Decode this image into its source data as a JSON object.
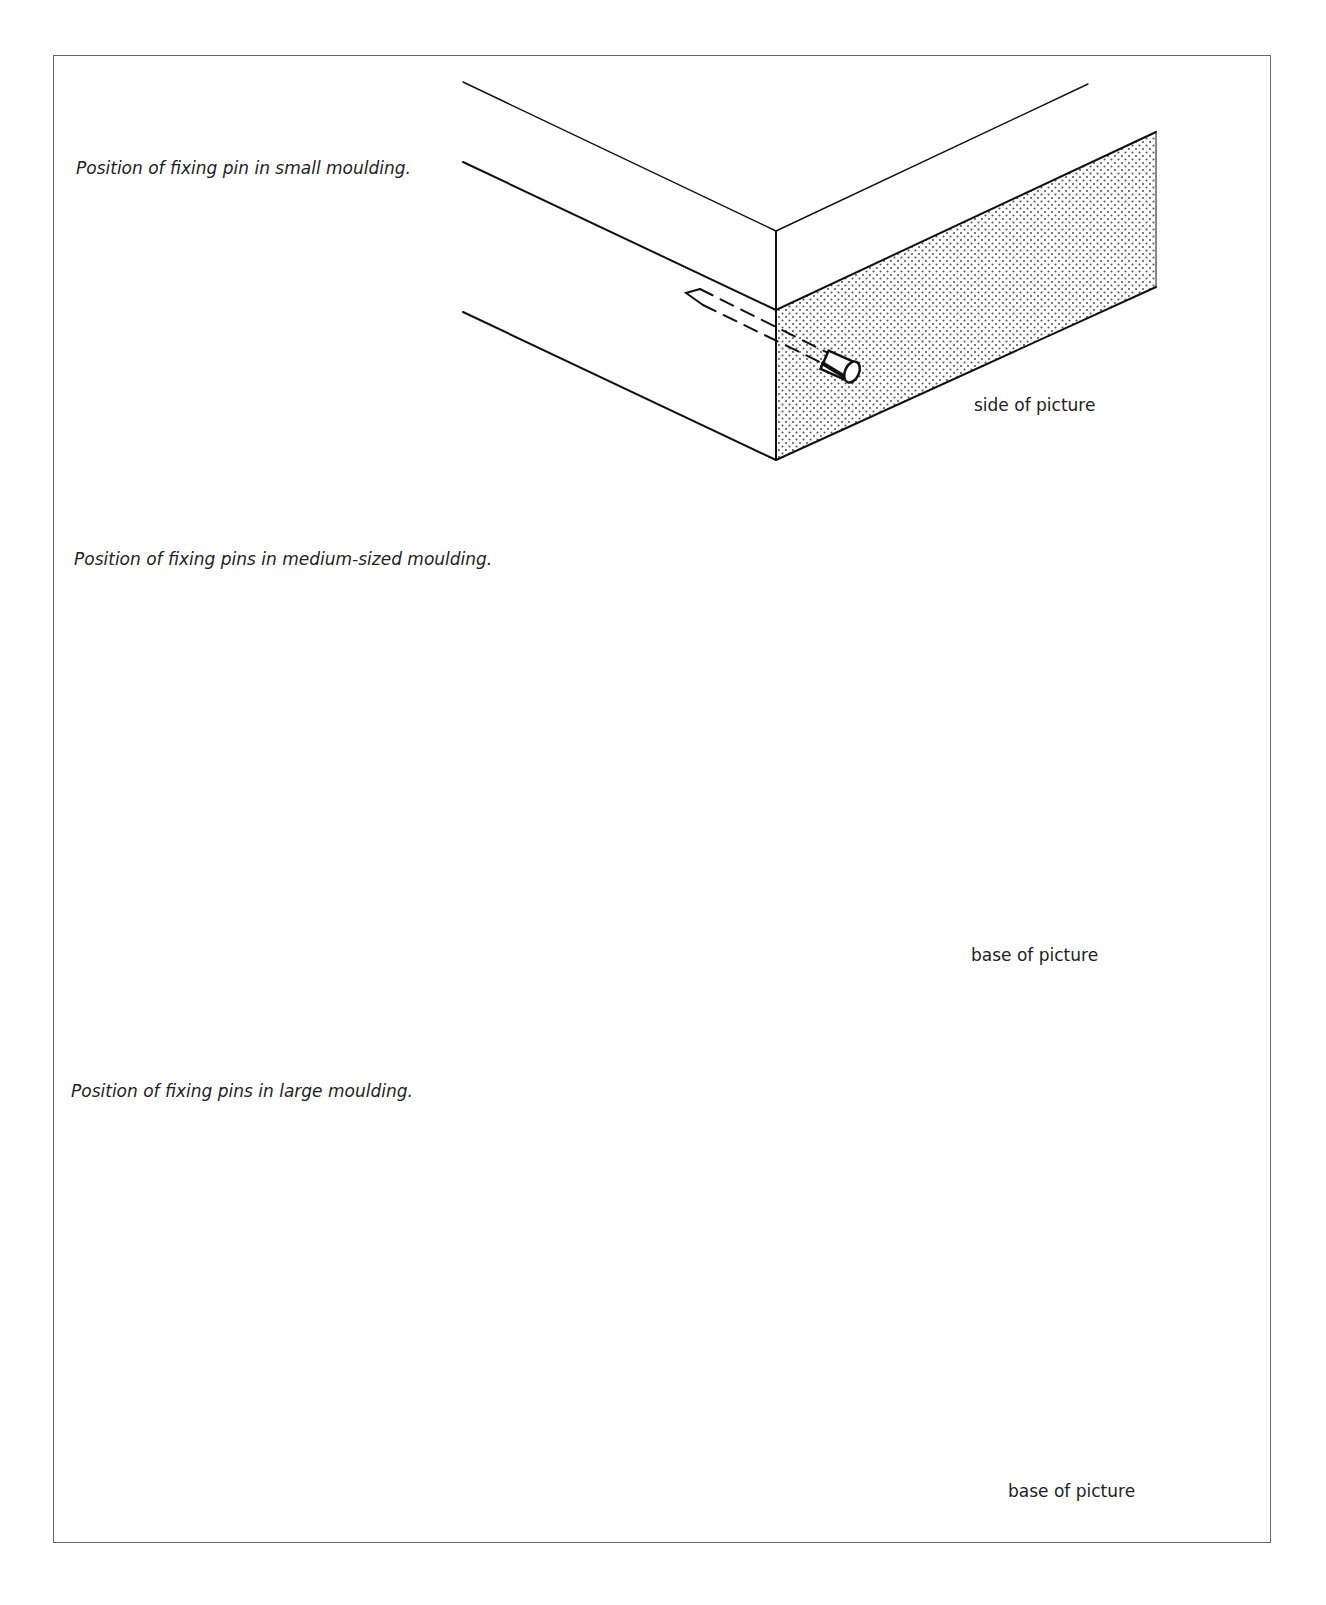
{
  "figures": [
    {
      "caption": "Position of fixing pin in small moulding.",
      "side_label": "side of picture",
      "pin_count": 1
    },
    {
      "caption": "Position of fixing pins in medium-sized moulding.",
      "side_label": "base of picture",
      "pin_count": 2
    },
    {
      "caption": "Position of fixing pins in large moulding.",
      "side_label": "base of picture",
      "pin_count": 3
    }
  ],
  "colors": {
    "line": "#111111",
    "frame": "#666666",
    "stipple": "#555555",
    "background": "#ffffff"
  }
}
